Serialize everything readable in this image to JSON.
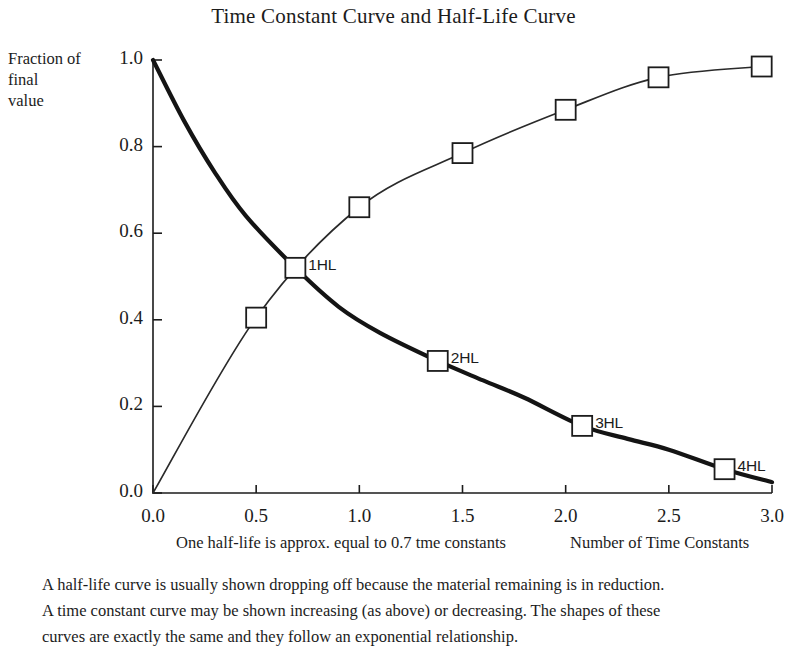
{
  "chart_data": {
    "type": "line",
    "title": "Time Constant Curve and Half-Life Curve",
    "xlabel": "Number of Time Constants",
    "ylabel": "Fraction of final value",
    "ylabel_lines": [
      "Fraction of",
      "final",
      "value"
    ],
    "xlim": [
      0.0,
      3.0
    ],
    "ylim": [
      0.0,
      1.0
    ],
    "grid": false,
    "legend": "none",
    "xticks": [
      "0.0",
      "0.5",
      "1.0",
      "1.5",
      "2.0",
      "2.5",
      "3.0"
    ],
    "xtick_values": [
      0.0,
      0.5,
      1.0,
      1.5,
      2.0,
      2.5,
      3.0
    ],
    "yticks": [
      "0.0",
      "0.2",
      "0.4",
      "0.6",
      "0.8",
      "1.0"
    ],
    "ytick_values": [
      0.0,
      0.2,
      0.4,
      0.6,
      0.8,
      1.0
    ],
    "series": [
      {
        "name": "Half-Life Curve (decaying)",
        "style": "thick",
        "x": [
          0.0,
          0.15,
          0.3,
          0.45,
          0.69,
          0.9,
          1.1,
          1.38,
          1.6,
          1.8,
          2.08,
          2.3,
          2.5,
          2.77,
          3.0
        ],
        "y": [
          1.0,
          0.86,
          0.74,
          0.64,
          0.52,
          0.43,
          0.37,
          0.305,
          0.26,
          0.22,
          0.155,
          0.125,
          0.1,
          0.055,
          0.025
        ],
        "markers": [
          {
            "x": 0.69,
            "y": 0.52,
            "label": "1HL"
          },
          {
            "x": 1.38,
            "y": 0.305,
            "label": "2HL"
          },
          {
            "x": 2.08,
            "y": 0.155,
            "label": "3HL"
          },
          {
            "x": 2.77,
            "y": 0.055,
            "label": "4HL"
          }
        ]
      },
      {
        "name": "Time Constant Curve (rising)",
        "style": "thin",
        "x": [
          0.0,
          0.5,
          1.0,
          1.5,
          2.0,
          2.45,
          2.95
        ],
        "y": [
          0.0,
          0.405,
          0.66,
          0.785,
          0.885,
          0.96,
          0.985
        ],
        "markers": [
          {
            "x": 0.5,
            "y": 0.405,
            "label": ""
          },
          {
            "x": 1.0,
            "y": 0.66,
            "label": ""
          },
          {
            "x": 1.5,
            "y": 0.785,
            "label": ""
          },
          {
            "x": 2.0,
            "y": 0.885,
            "label": ""
          },
          {
            "x": 2.45,
            "y": 0.96,
            "label": ""
          },
          {
            "x": 2.95,
            "y": 0.985,
            "label": ""
          }
        ]
      }
    ],
    "annotations": [
      "One half-life is approx. equal to 0.7 tme constants",
      "Number of Time Constants"
    ]
  },
  "axis_notes": {
    "left": "One half-life is approx. equal to 0.7 tme constants",
    "right": "Number of Time Constants"
  },
  "caption": {
    "line1": "A half-life curve is usually shown dropping off because the material remaining is in reduction.",
    "line2": "A time constant curve may be shown increasing (as above) or decreasing. The shapes of these",
    "line3": "curves are exactly the same and they follow an exponential relationship."
  },
  "colors": {
    "ink": "#1c1c1c",
    "decay_curve": "#141414",
    "rise_curve": "#2a2a2a",
    "marker_fill": "#ffffff",
    "background": "#ffffff"
  }
}
